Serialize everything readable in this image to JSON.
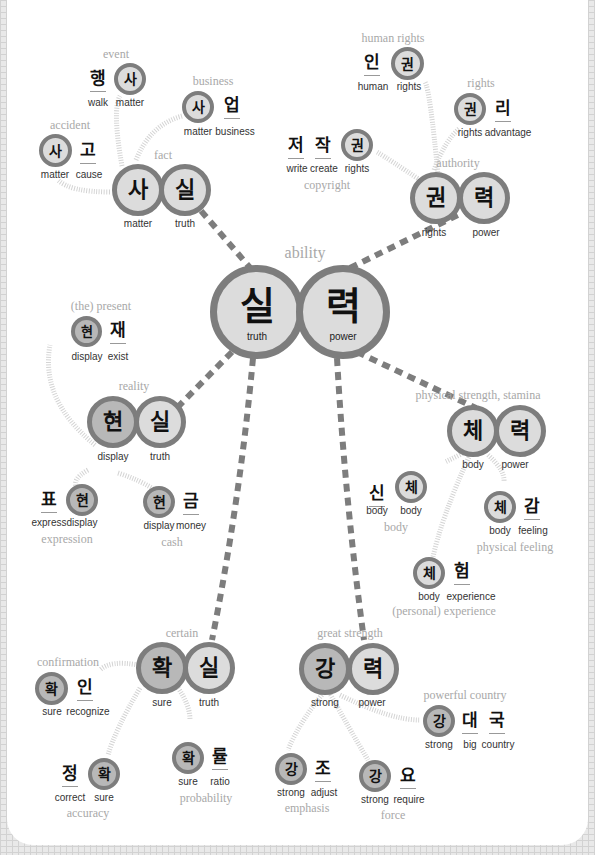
{
  "colors": {
    "ring": "#7d7d7d",
    "fill_light": "#dcdcdc",
    "fill_dark": "#b8b8b8",
    "meaning_text": "#a8a8a8",
    "connector": "#7d7d7d",
    "dotted_connector": "#cfcfcf",
    "grid_background": "#e9e9e9"
  },
  "center": {
    "meaning": "ability",
    "syllables": [
      {
        "char": "실",
        "gloss": "truth"
      },
      {
        "char": "력",
        "gloss": "power"
      }
    ]
  },
  "clusters": {
    "fact": {
      "meaning": "fact",
      "syllables": [
        {
          "char": "사",
          "gloss": "matter"
        },
        {
          "char": "실",
          "gloss": "truth"
        }
      ],
      "children": [
        {
          "meaning": "event",
          "syllables": [
            {
              "char": "행",
              "gloss": "walk"
            },
            {
              "char": "사",
              "gloss": "matter"
            }
          ]
        },
        {
          "meaning": "business",
          "syllables": [
            {
              "char": "사",
              "gloss": "matter"
            },
            {
              "char": "업",
              "gloss": "business"
            }
          ]
        },
        {
          "meaning": "accident",
          "syllables": [
            {
              "char": "사",
              "gloss": "matter"
            },
            {
              "char": "고",
              "gloss": "cause"
            }
          ]
        }
      ]
    },
    "authority": {
      "meaning": "authority",
      "syllables": [
        {
          "char": "권",
          "gloss": "rights"
        },
        {
          "char": "력",
          "gloss": "power"
        }
      ],
      "children": [
        {
          "meaning": "human rights",
          "syllables": [
            {
              "char": "인",
              "gloss": "human"
            },
            {
              "char": "권",
              "gloss": "rights"
            }
          ]
        },
        {
          "meaning": "rights",
          "syllables": [
            {
              "char": "권",
              "gloss": "rights"
            },
            {
              "char": "리",
              "gloss": "advantage"
            }
          ]
        },
        {
          "meaning": "copyright",
          "syllables": [
            {
              "char": "저",
              "gloss": "write"
            },
            {
              "char": "작",
              "gloss": "create"
            },
            {
              "char": "권",
              "gloss": "rights"
            }
          ]
        }
      ]
    },
    "reality": {
      "meaning": "reality",
      "syllables": [
        {
          "char": "현",
          "gloss": "display"
        },
        {
          "char": "실",
          "gloss": "truth"
        }
      ],
      "children": [
        {
          "meaning": "(the) present",
          "syllables": [
            {
              "char": "현",
              "gloss": "display"
            },
            {
              "char": "재",
              "gloss": "exist"
            }
          ]
        },
        {
          "meaning": "expression",
          "syllables": [
            {
              "char": "표",
              "gloss": "express"
            },
            {
              "char": "현",
              "gloss": "display"
            }
          ]
        },
        {
          "meaning": "cash",
          "syllables": [
            {
              "char": "현",
              "gloss": "display"
            },
            {
              "char": "금",
              "gloss": "money"
            }
          ]
        }
      ]
    },
    "stamina": {
      "meaning": "physical strength, stamina",
      "syllables": [
        {
          "char": "체",
          "gloss": "body"
        },
        {
          "char": "력",
          "gloss": "power"
        }
      ],
      "children": [
        {
          "meaning": "body",
          "syllables": [
            {
              "char": "신",
              "gloss": "body"
            },
            {
              "char": "체",
              "gloss": "body"
            }
          ]
        },
        {
          "meaning": "physical feeling",
          "syllables": [
            {
              "char": "체",
              "gloss": "body"
            },
            {
              "char": "감",
              "gloss": "feeling"
            }
          ]
        },
        {
          "meaning": "(personal) experience",
          "syllables": [
            {
              "char": "체",
              "gloss": "body"
            },
            {
              "char": "험",
              "gloss": "experience"
            }
          ]
        }
      ]
    },
    "certain": {
      "meaning": "certain",
      "syllables": [
        {
          "char": "확",
          "gloss": "sure"
        },
        {
          "char": "실",
          "gloss": "truth"
        }
      ],
      "children": [
        {
          "meaning": "confirmation",
          "syllables": [
            {
              "char": "확",
              "gloss": "sure"
            },
            {
              "char": "인",
              "gloss": "recognize"
            }
          ]
        },
        {
          "meaning": "accuracy",
          "syllables": [
            {
              "char": "정",
              "gloss": "correct"
            },
            {
              "char": "확",
              "gloss": "sure"
            }
          ]
        },
        {
          "meaning": "probability",
          "syllables": [
            {
              "char": "확",
              "gloss": "sure"
            },
            {
              "char": "률",
              "gloss": "ratio"
            }
          ]
        }
      ]
    },
    "great_strength": {
      "meaning": "great strength",
      "syllables": [
        {
          "char": "강",
          "gloss": "strong"
        },
        {
          "char": "력",
          "gloss": "power"
        }
      ],
      "children": [
        {
          "meaning": "powerful country",
          "syllables": [
            {
              "char": "강",
              "gloss": "strong"
            },
            {
              "char": "대",
              "gloss": "big"
            },
            {
              "char": "국",
              "gloss": "country"
            }
          ]
        },
        {
          "meaning": "emphasis",
          "syllables": [
            {
              "char": "강",
              "gloss": "strong"
            },
            {
              "char": "조",
              "gloss": "adjust"
            }
          ]
        },
        {
          "meaning": "force",
          "syllables": [
            {
              "char": "강",
              "gloss": "strong"
            },
            {
              "char": "요",
              "gloss": "require"
            }
          ]
        }
      ]
    }
  }
}
